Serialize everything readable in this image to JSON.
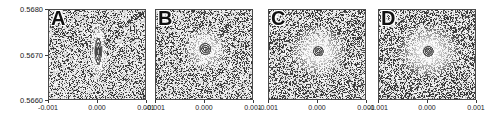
{
  "chart_data": {
    "type": "heatmap",
    "title": "",
    "subtitle": "",
    "xlabel": "",
    "ylabel": "",
    "layout": "1x4 panel row, shared axes, only leftmost panel shows y tick labels",
    "grid": false,
    "legend": "none",
    "xlim": [
      -0.001,
      0.001
    ],
    "ylim": [
      0.566,
      0.568
    ],
    "x_ticks": [
      -0.001,
      0.0,
      0.001
    ],
    "x_tick_labels": [
      "-0.001",
      "0.000",
      "0.001"
    ],
    "y_ticks": [
      0.566,
      0.567,
      0.568
    ],
    "y_tick_labels": [
      "0.5660",
      "0.5670",
      "0.5680"
    ],
    "colormap": "grayscale (dark = high intensity speckle background, white = low)",
    "panels": [
      {
        "label": "A",
        "feature": "vertical teardrop streak with sharp downward tail and small bright core",
        "core_x": 0.0,
        "core_y": 0.5671,
        "core_shape": "elongated vertical lens",
        "core_width": 0.00012,
        "core_height": 0.00055,
        "tail_length": 0.00075,
        "contour_rings": 3,
        "halo_radius_x": 0.00018,
        "halo_radius_y": 0.00075,
        "background": "dense speckle with diagonal streaks from upper-right"
      },
      {
        "label": "B",
        "feature": "rounded concentric rings, slight vertical elongation, diffuse halo",
        "core_x": 0.0,
        "core_y": 0.56715,
        "core_shape": "near-circular",
        "core_width": 0.00022,
        "core_height": 0.00024,
        "tail_length": 0.0,
        "contour_rings": 3,
        "halo_radius_x": 0.00046,
        "halo_radius_y": 0.00048,
        "background": "dense speckle with diagonal streak from upper-right"
      },
      {
        "label": "C",
        "feature": "compact circular core with broad bright diffuse halo",
        "core_x": 0.0,
        "core_y": 0.5671,
        "core_shape": "circular",
        "core_width": 0.00019,
        "core_height": 0.0002,
        "tail_length": 0.0,
        "contour_rings": 3,
        "halo_radius_x": 0.0006,
        "halo_radius_y": 0.00058,
        "background": "dense speckle, fainter diagonal streaking"
      },
      {
        "label": "D",
        "feature": "compact circular core with broadest, brightest diffuse halo",
        "core_x": 0.0,
        "core_y": 0.5671,
        "core_shape": "circular",
        "core_width": 0.00019,
        "core_height": 0.00021,
        "tail_length": 0.0,
        "contour_rings": 3,
        "halo_radius_x": 0.00066,
        "halo_radius_y": 0.00062,
        "background": "dense speckle, minimal streaking"
      }
    ],
    "colors": {
      "axis": "#4a4a4a",
      "text": "#1a1a1a",
      "speckle_dark": "#2b2b2b",
      "speckle_light": "#ffffff",
      "background": "#ffffff"
    }
  }
}
